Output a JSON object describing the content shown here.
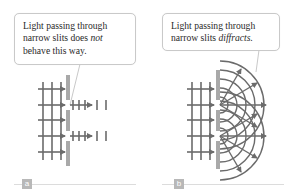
{
  "figure": {
    "colors": {
      "wave_lines": "#6b6b6b",
      "barrier": "#a9a9a9",
      "callout_border": "#c9c9c9",
      "label_badge": "#b8b8b8",
      "text": "#2a2a2a"
    },
    "panels": [
      {
        "id": "a",
        "label": "a",
        "callout": {
          "line1": "Light passing through",
          "line2_prefix": "narrow slits does ",
          "line2_emphasis": "not",
          "line3": "behave this way."
        },
        "description": "Plane waves pass straight through two slits without spreading"
      },
      {
        "id": "b",
        "label": "b",
        "callout": {
          "line1": "Light passing through",
          "line2_prefix": "narrow slits ",
          "line2_emphasis": "diffracts."
        },
        "description": "Plane waves pass through two slits and spread out as circular wavefronts"
      }
    ]
  }
}
